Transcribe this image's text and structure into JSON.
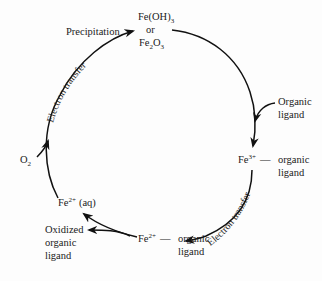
{
  "diagram": {
    "nodes": {
      "top": {
        "line1_base": "Fe(OH)",
        "line1_sub": "3",
        "line2": "or",
        "line3_fe": "Fe",
        "line3_sub1": "2",
        "line3_o": "O",
        "line3_sub2": "3"
      },
      "right": {
        "fe": "Fe",
        "charge": "3+",
        "dash": "—",
        "line1": "organic",
        "line2": "ligand"
      },
      "bottom_right": {
        "fe": "Fe",
        "charge": "2+",
        "dash": "—",
        "line1": "organic",
        "line2": "ligand",
        "line3": "oxidized"
      },
      "left": {
        "fe": "Fe",
        "charge": "2+",
        "state": "(aq)"
      }
    },
    "inputs": {
      "organic_ligand": {
        "line1": "Organic",
        "line2": "ligand"
      },
      "oxygen": {
        "base": "O",
        "sub": "2"
      }
    },
    "outputs": {
      "oxidized_ligand": {
        "line1": "Oxidized",
        "line2": "organic",
        "line3": "ligand"
      }
    },
    "process_labels": {
      "precipitation": "Precipitation",
      "electron_transfer_left": "Electron transfer",
      "electron_transfer_right": "Electron transfer"
    },
    "colors": {
      "stroke": "#111111",
      "text": "#1a1a1a",
      "background": "#fdfdfd"
    }
  }
}
